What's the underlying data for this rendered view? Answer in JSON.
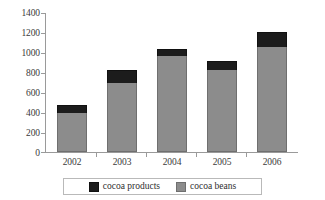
{
  "chart_data": {
    "type": "bar",
    "subtype": "stacked-bar",
    "title": "",
    "subtitle": "",
    "xlabel": "",
    "ylabel": "",
    "categories": [
      "2002",
      "2003",
      "2004",
      "2005",
      "2006"
    ],
    "series": [
      {
        "name": "cocoa beans",
        "color": "#8c8c8c",
        "values": [
          395,
          695,
          965,
          830,
          1060
        ]
      },
      {
        "name": "cocoa products",
        "color": "#1c1c1c",
        "values": [
          75,
          135,
          75,
          90,
          150
        ]
      }
    ],
    "stack_totals": [
      470,
      830,
      1040,
      920,
      1210
    ],
    "ylim": [
      0,
      1400
    ],
    "ytick_step": 200,
    "yticks": [
      "0",
      "200",
      "400",
      "600",
      "800",
      "1000",
      "1200",
      "1400"
    ],
    "grid": false,
    "legend_position": "bottom",
    "stack_order_bottom_to_top": [
      "cocoa beans",
      "cocoa products"
    ]
  },
  "axes": {
    "y_tick_labels": [
      "1400",
      "1200",
      "1000",
      "800",
      "600",
      "400",
      "200",
      "0"
    ],
    "x_tick_labels": [
      "2002",
      "2003",
      "2004",
      "2005",
      "2006"
    ]
  },
  "legend": {
    "items": [
      {
        "label": "cocoa products",
        "color": "#1c1c1c"
      },
      {
        "label": "cocoa beans",
        "color": "#8c8c8c"
      }
    ]
  },
  "style": {
    "background": "#ffffff",
    "axis_color": "#9a9a9a",
    "text_color": "#3a3a3a",
    "legend_border": "#b9b9b9"
  }
}
